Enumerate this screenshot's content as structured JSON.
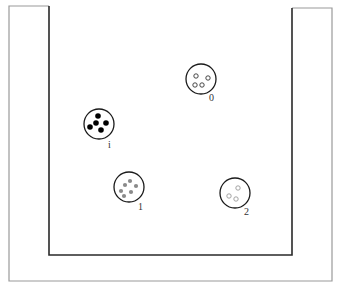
{
  "diagram": {
    "width": 339,
    "height": 287,
    "outer_frame": {
      "color": "#9a9a9a",
      "points": [
        [
          9,
          6
        ],
        [
          50,
          6
        ],
        [
          50,
          8
        ],
        [
          9,
          8
        ],
        [
          9,
          281
        ],
        [
          332,
          281
        ],
        [
          332,
          8
        ],
        [
          292,
          8
        ]
      ],
      "left": 9,
      "right": 332,
      "top_left": 6,
      "top_right": 8,
      "bottom": 281
    },
    "container": {
      "color": "#2a2a2a",
      "left_x": 49,
      "right_x": 292,
      "top_left_y": 6,
      "top_right_y": 8,
      "bottom_y": 255
    },
    "circles": [
      {
        "id": "circle-0",
        "label": "0",
        "cx": 201,
        "cy": 79,
        "r": 15,
        "label_x": 209,
        "label_y": 101,
        "dot_style": "hollow",
        "dot_color": "#333333",
        "dots": [
          [
            196,
            76
          ],
          [
            208,
            78
          ],
          [
            195,
            85
          ],
          [
            202,
            85
          ]
        ],
        "dot_r": 2.2
      },
      {
        "id": "circle-i",
        "label": "i",
        "cx": 99,
        "cy": 124,
        "r": 15,
        "label_x": 108,
        "label_y": 148,
        "dot_style": "solid",
        "dot_color": "#000000",
        "dots": [
          [
            98,
            116
          ],
          [
            96,
            123
          ],
          [
            106,
            123
          ],
          [
            90,
            127
          ],
          [
            101,
            130
          ]
        ],
        "dot_r": 2.8
      },
      {
        "id": "circle-1",
        "label": "1",
        "cx": 129,
        "cy": 187,
        "r": 15,
        "label_x": 138,
        "label_y": 210,
        "dot_style": "solid",
        "dot_color": "#8a8a8a",
        "dots": [
          [
            125,
            185
          ],
          [
            130,
            181
          ],
          [
            136,
            186
          ],
          [
            121,
            191
          ],
          [
            131,
            192
          ],
          [
            124,
            196
          ]
        ],
        "dot_r": 2.1
      },
      {
        "id": "circle-2",
        "label": "2",
        "cx": 235,
        "cy": 193,
        "r": 15,
        "label_x": 244,
        "label_y": 215,
        "dot_style": "hollow",
        "dot_color": "#9a9a9a",
        "dots": [
          [
            238,
            188
          ],
          [
            229,
            196
          ],
          [
            236,
            199
          ]
        ],
        "dot_r": 2.2
      }
    ]
  }
}
